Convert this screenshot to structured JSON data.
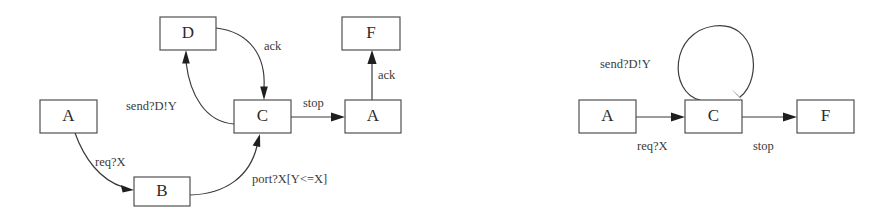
{
  "figure": {
    "background_color": "#ffffff",
    "stroke_color": "#3b3b3b",
    "box_stroke_color": "#4a4a4a",
    "text_color": "#2b2b2b",
    "width": 888,
    "height": 216
  },
  "diagrams": [
    {
      "id": "left-diagram",
      "name": "expanded-transition-diagram",
      "nodes": [
        {
          "id": "left-d",
          "label": "D",
          "x": 160,
          "y": 17,
          "w": 56,
          "h": 33
        },
        {
          "id": "left-f",
          "label": "F",
          "x": 342,
          "y": 17,
          "w": 58,
          "h": 33
        },
        {
          "id": "left-a1",
          "label": "A",
          "x": 40,
          "y": 100,
          "w": 57,
          "h": 33
        },
        {
          "id": "left-c",
          "label": "C",
          "x": 234,
          "y": 100,
          "w": 57,
          "h": 33
        },
        {
          "id": "left-a2",
          "label": "A",
          "x": 345,
          "y": 100,
          "w": 56,
          "h": 33
        },
        {
          "id": "left-b",
          "label": "B",
          "x": 134,
          "y": 177,
          "w": 56,
          "h": 29
        }
      ],
      "edges": [
        {
          "id": "left-edge-a1-b",
          "from": "left-a1",
          "to": "left-b",
          "label": "req?X",
          "label_x": 95,
          "label_y": 163
        },
        {
          "id": "left-edge-b-c",
          "from": "left-b",
          "to": "left-c",
          "label": "port?X[Y<=X]",
          "label_x": 252,
          "label_y": 180
        },
        {
          "id": "left-edge-c-d",
          "from": "left-c",
          "to": "left-d",
          "label": "send?D!Y",
          "label_x": 126,
          "label_y": 107
        },
        {
          "id": "left-edge-d-c",
          "from": "left-d",
          "to": "left-c",
          "label": "ack",
          "label_x": 264,
          "label_y": 47
        },
        {
          "id": "left-edge-c-a2",
          "from": "left-c",
          "to": "left-a2",
          "label": "stop",
          "label_x": 303,
          "label_y": 104
        },
        {
          "id": "left-edge-a2-f",
          "from": "left-a2",
          "to": "left-f",
          "label": "ack",
          "label_x": 378,
          "label_y": 76
        }
      ]
    },
    {
      "id": "right-diagram",
      "name": "abstracted-transition-diagram",
      "nodes": [
        {
          "id": "right-a",
          "label": "A",
          "x": 579,
          "y": 100,
          "w": 57,
          "h": 33
        },
        {
          "id": "right-c",
          "label": "C",
          "x": 685,
          "y": 100,
          "w": 57,
          "h": 33
        },
        {
          "id": "right-f",
          "label": "F",
          "x": 797,
          "y": 100,
          "w": 57,
          "h": 33
        }
      ],
      "edges": [
        {
          "id": "right-edge-a-c",
          "from": "right-a",
          "to": "right-c",
          "label": "req?X",
          "label_x": 637,
          "label_y": 147
        },
        {
          "id": "right-edge-c-c",
          "from": "right-c",
          "to": "right-c",
          "label": "send?D!Y",
          "label_x": 600,
          "label_y": 65
        },
        {
          "id": "right-edge-c-f",
          "from": "right-c",
          "to": "right-f",
          "label": "stop",
          "label_x": 753,
          "label_y": 147
        }
      ]
    }
  ]
}
